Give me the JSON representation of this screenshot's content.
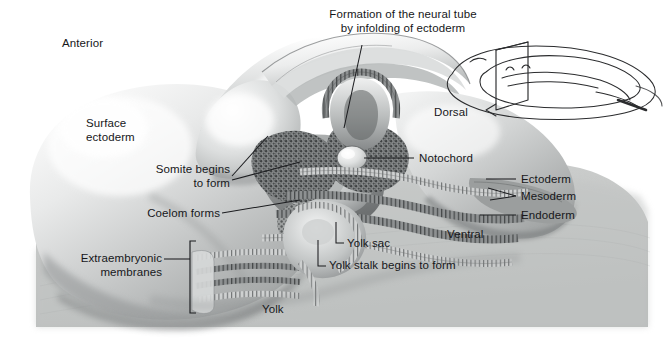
{
  "figure": {
    "type": "anatomical-illustration",
    "style": "grayscale airbrush medical illustration with line-drawing inset",
    "background_color": "#ffffff",
    "label_color": "#16171a",
    "leader_color": "#1b1c1f"
  },
  "labels": {
    "anterior": "Anterior",
    "surface_ectoderm": "Surface\nectoderm",
    "somite": "Somite begins\nto form",
    "coelom": "Coelom forms",
    "extraembryonic": "Extraembryonic\nmembranes",
    "yolk": "Yolk",
    "neural_tube": "Formation of the neural tube\nby infolding of ectoderm",
    "dorsal": "Dorsal",
    "notochord": "Notochord",
    "ectoderm": "Ectoderm",
    "mesoderm": "Mesoderm",
    "endoderm": "Endoderm",
    "ventral": "Ventral",
    "yolk_sac": "Yolk sac",
    "yolk_stalk": "Yolk stalk begins to form"
  },
  "structures": [
    {
      "name": "neural-tube",
      "label": "Formation of the neural tube by infolding of ectoderm"
    },
    {
      "name": "notochord",
      "label": "Notochord"
    },
    {
      "name": "somite",
      "label": "Somite begins to form"
    },
    {
      "name": "coelom",
      "label": "Coelom forms"
    },
    {
      "name": "extraembryonic-membranes",
      "label": "Extraembryonic membranes"
    },
    {
      "name": "yolk-sac",
      "label": "Yolk sac"
    },
    {
      "name": "yolk-stalk",
      "label": "Yolk stalk begins to form"
    },
    {
      "name": "yolk",
      "label": "Yolk"
    },
    {
      "name": "surface-ectoderm",
      "label": "Surface ectoderm"
    }
  ],
  "germ_layers": [
    {
      "name": "ectoderm",
      "label": "Ectoderm"
    },
    {
      "name": "mesoderm",
      "label": "Mesoderm"
    },
    {
      "name": "endoderm",
      "label": "Endoderm"
    }
  ],
  "orientation": [
    {
      "name": "anterior",
      "label": "Anterior"
    },
    {
      "name": "dorsal",
      "label": "Dorsal"
    },
    {
      "name": "ventral",
      "label": "Ventral"
    }
  ],
  "inset": {
    "name": "whole-embryo-orientation-inset",
    "description": "Line drawing of whole embryo with a sectioning plane indicating the plane of the main illustration"
  }
}
